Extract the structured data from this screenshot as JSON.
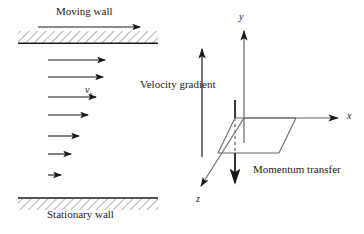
{
  "figure": {
    "stroke_color": "#1a1a1a",
    "background": "#ffffff",
    "width": 364,
    "height": 234
  },
  "left_panel": {
    "moving_wall_label": "Moving wall",
    "stationary_wall_label": "Stationary wall",
    "velocity_symbol": "v",
    "velocity_subscript": "x",
    "wall_motion_arrow": {
      "x1": 38,
      "y1": 27,
      "x2": 142,
      "y2": 27
    },
    "top_wall": {
      "x": 18,
      "y": 31,
      "width": 140,
      "height": 12,
      "hatched": true
    },
    "bottom_wall": {
      "x": 18,
      "y": 198,
      "width": 140,
      "height": 11,
      "hatched": true
    },
    "profile_arrows": [
      {
        "x1": 48,
        "y1": 60,
        "x2": 108,
        "y2": 60
      },
      {
        "x1": 48,
        "y1": 77,
        "x2": 106,
        "y2": 77
      },
      {
        "x1": 48,
        "y1": 97,
        "x2": 99,
        "y2": 97
      },
      {
        "x1": 48,
        "y1": 115,
        "x2": 91,
        "y2": 115
      },
      {
        "x1": 48,
        "y1": 136,
        "x2": 82,
        "y2": 136
      },
      {
        "x1": 48,
        "y1": 154,
        "x2": 74,
        "y2": 154
      },
      {
        "x1": 48,
        "y1": 175,
        "x2": 64,
        "y2": 175
      }
    ]
  },
  "right_panel": {
    "velocity_gradient_label": "Velocity gradient",
    "momentum_transfer_label": "Momentum transfer",
    "axis_labels": {
      "x": "x",
      "y": "y",
      "z": "z"
    },
    "velocity_gradient_arrow": {
      "x1": 202,
      "y1": 157,
      "x2": 202,
      "y2": 46
    },
    "momentum_transfer_arrow": {
      "x1": 235,
      "y1": 100,
      "x2": 235,
      "y2": 186
    },
    "y_axis": {
      "x1": 244,
      "y1": 143,
      "x2": 244,
      "y2": 28
    },
    "x_axis": {
      "x1": 244,
      "y1": 118,
      "x2": 341,
      "y2": 118
    },
    "z_axis": {
      "x1": 244,
      "y1": 118,
      "x2": 199,
      "y2": 189
    },
    "plane": {
      "p1": {
        "x": 235,
        "y": 118
      },
      "p2": {
        "x": 296,
        "y": 118
      },
      "p3": {
        "x": 279,
        "y": 153
      },
      "p4": {
        "x": 218,
        "y": 153
      }
    }
  }
}
